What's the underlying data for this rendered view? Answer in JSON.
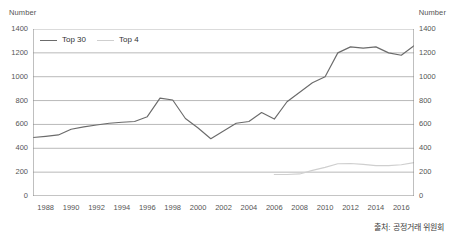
{
  "chart_data": {
    "type": "line",
    "title": "",
    "subtitle": "",
    "xlabel": "",
    "ylabel": "Number",
    "ylabel_right": "Number",
    "ylim": [
      0,
      1400
    ],
    "ytick_values": [
      0,
      200,
      400,
      600,
      800,
      1000,
      1200,
      1400
    ],
    "ytick_labels": [
      "0",
      "200",
      "400",
      "600",
      "800",
      "1000",
      "1200",
      "1400"
    ],
    "ytick_labels_right": [
      "0",
      "200",
      "400",
      "600",
      "800",
      "1000",
      "1200",
      "1400"
    ],
    "xlim": [
      1987,
      2017
    ],
    "x": [
      1987,
      1988,
      1989,
      1990,
      1991,
      1992,
      1993,
      1994,
      1995,
      1996,
      1997,
      1998,
      1999,
      2000,
      2001,
      2002,
      2003,
      2004,
      2005,
      2006,
      2007,
      2008,
      2009,
      2010,
      2011,
      2012,
      2013,
      2014,
      2015,
      2016,
      2017
    ],
    "xtick_values": [
      1987,
      1988,
      1989,
      1990,
      1991,
      1992,
      1993,
      1994,
      1995,
      1996,
      1997,
      1998,
      1999,
      2000,
      2001,
      2002,
      2003,
      2004,
      2005,
      2006,
      2007,
      2008,
      2009,
      2010,
      2011,
      2012,
      2013,
      2014,
      2015,
      2016,
      2017
    ],
    "xtick_labeled": [
      1988,
      1990,
      1992,
      1994,
      1996,
      1998,
      2000,
      2002,
      2004,
      2006,
      2008,
      2010,
      2012,
      2014,
      2016
    ],
    "xtick_labels": [
      "1988",
      "1990",
      "1992",
      "1994",
      "1996",
      "1998",
      "2000",
      "2002",
      "2004",
      "2006",
      "2008",
      "2010",
      "2012",
      "2014",
      "2016"
    ],
    "grid": true,
    "grid_axis": "y",
    "legend_position": "top-left",
    "series": [
      {
        "name": "Top 30",
        "color": "#6b6b6b",
        "x": [
          1987,
          1988,
          1989,
          1990,
          1991,
          1992,
          1993,
          1994,
          1995,
          1996,
          1997,
          1998,
          1999,
          2000,
          2001,
          2002,
          2003,
          2004,
          2005,
          2006,
          2007,
          2008,
          2009,
          2010,
          2011,
          2012,
          2013,
          2014,
          2015,
          2016,
          2017
        ],
        "values": [
          490,
          500,
          512,
          560,
          580,
          595,
          610,
          618,
          625,
          665,
          820,
          805,
          650,
          570,
          480,
          545,
          610,
          625,
          700,
          645,
          790,
          870,
          950,
          1000,
          1200,
          1250,
          1240,
          1250,
          1200,
          1180,
          1260
        ]
      },
      {
        "name": "Top 4",
        "color": "#cfcfcf",
        "x": [
          2006,
          2007,
          2008,
          2009,
          2010,
          2011,
          2012,
          2013,
          2014,
          2015,
          2016,
          2017
        ],
        "values": [
          180,
          180,
          185,
          215,
          240,
          270,
          272,
          265,
          255,
          255,
          262,
          280
        ]
      }
    ]
  },
  "figure": {
    "ylabel_left": "Number",
    "ylabel_right": "Number",
    "source_note": "출처: 공정거래 위원회"
  },
  "legend": {
    "items": [
      {
        "label": "Top 30",
        "color": "#6b6b6b"
      },
      {
        "label": "Top 4",
        "color": "#cfcfcf"
      }
    ]
  },
  "colors": {
    "top30_line": "#6b6b6b",
    "top4_line": "#cfcfcf",
    "gridline": "#9a9a9a",
    "axis": "#8a8a8a",
    "tick_text": "#555555",
    "background": "#ffffff"
  }
}
